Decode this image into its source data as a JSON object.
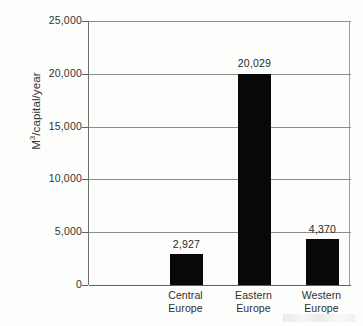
{
  "chart_data": {
    "type": "bar",
    "title": "",
    "xlabel": "",
    "ylabel": "M3/capital/year",
    "ylabel_parts": {
      "prefix": "M",
      "superscript": "3",
      "suffix": "/capital/year"
    },
    "categories": [
      "Central Europe",
      "Eastern Europe",
      "Western Europe"
    ],
    "category_lines": [
      [
        "Central",
        "Europe"
      ],
      [
        "Eastern",
        "Europe"
      ],
      [
        "Western",
        "Europe"
      ]
    ],
    "values": [
      2927,
      20029,
      4370
    ],
    "value_labels": [
      "2,927",
      "20,029",
      "4,370"
    ],
    "ylim": [
      0,
      25000
    ],
    "ytick_values": [
      0,
      5000,
      10000,
      15000,
      20000,
      25000
    ],
    "ytick_labels": [
      "0",
      "5,000",
      "10,000",
      "15,000",
      "20,000",
      "25,000"
    ],
    "grid": true,
    "grid_orientation": "horizontal",
    "legend": false,
    "legend_position": "none",
    "bar_color": "#080808",
    "axis_color": "#5f6162",
    "grid_color": "#8b8d8e",
    "background_color": "#fdfdfc"
  }
}
